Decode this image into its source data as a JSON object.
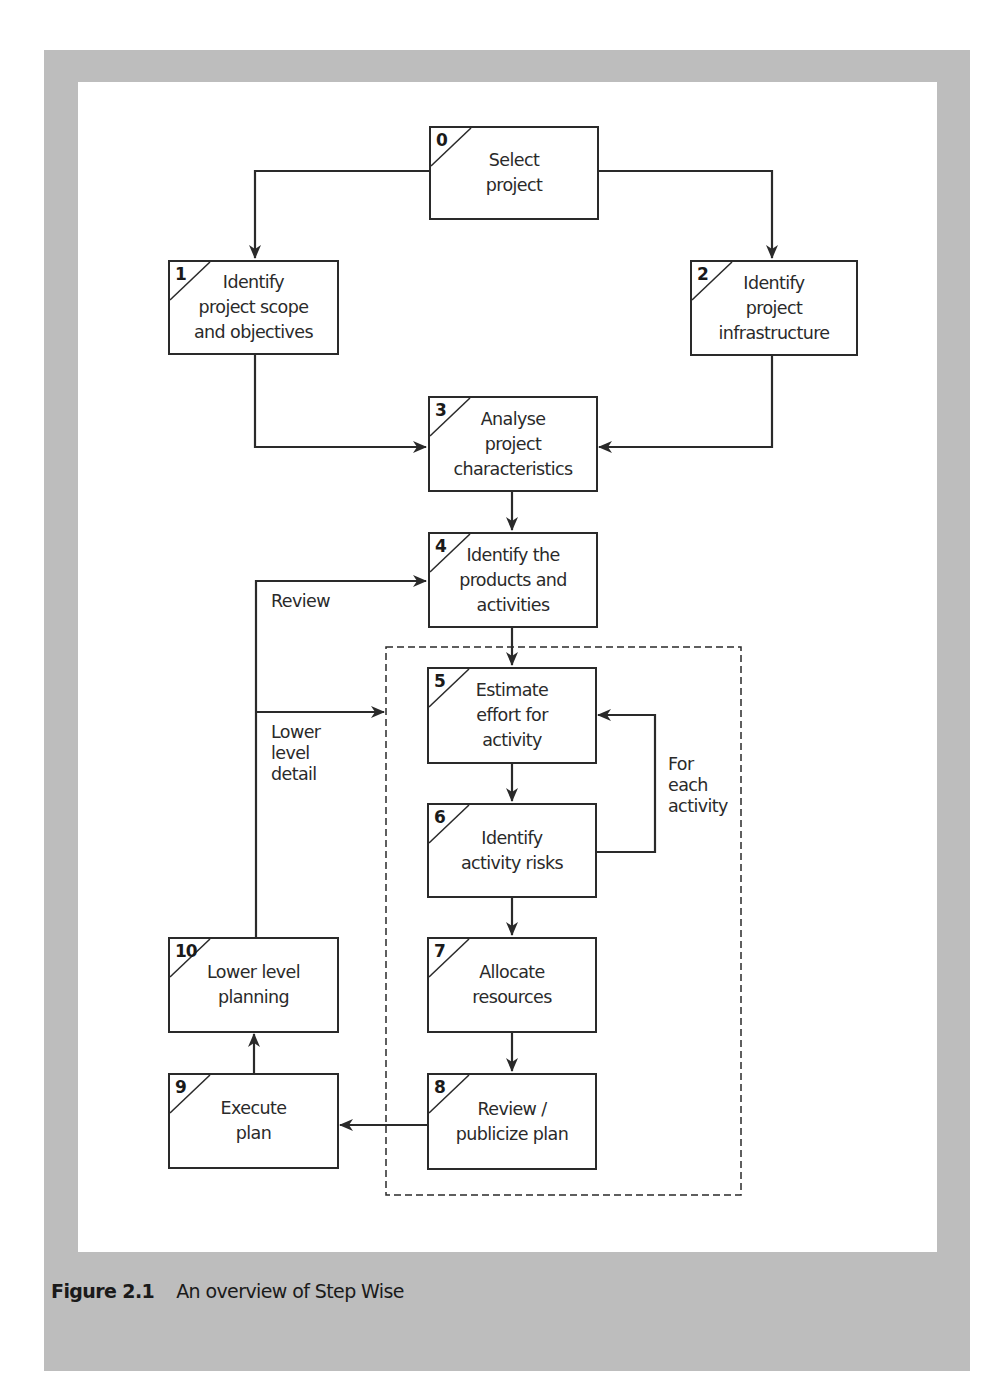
{
  "figure": {
    "number_label": "Figure 2.1",
    "title": "An overview of Step Wise"
  },
  "colors": {
    "frame": "#bdbdbd",
    "line": "#2a2a2a",
    "background": "#ffffff"
  },
  "steps": [
    {
      "id": "0",
      "label": "Select\nproject"
    },
    {
      "id": "1",
      "label": "Identify\nproject scope\nand objectives"
    },
    {
      "id": "2",
      "label": "Identify\nproject\ninfrastructure"
    },
    {
      "id": "3",
      "label": "Analyse\nproject\ncharacteristics"
    },
    {
      "id": "4",
      "label": "Identify the\nproducts and\nactivities"
    },
    {
      "id": "5",
      "label": "Estimate\neffort for\nactivity"
    },
    {
      "id": "6",
      "label": "Identify\nactivity risks"
    },
    {
      "id": "7",
      "label": "Allocate\nresources"
    },
    {
      "id": "8",
      "label": "Review /\npublicize plan"
    },
    {
      "id": "9",
      "label": "Execute\nplan"
    },
    {
      "id": "10",
      "label": "Lower level\nplanning"
    }
  ],
  "annotations": {
    "review": "Review",
    "lower_level_detail": "Lower\nlevel\ndetail",
    "for_each_activity": "For\neach\nactivity"
  },
  "edges": [
    {
      "from": "0",
      "to": "1"
    },
    {
      "from": "0",
      "to": "2"
    },
    {
      "from": "1",
      "to": "3"
    },
    {
      "from": "2",
      "to": "3"
    },
    {
      "from": "3",
      "to": "4"
    },
    {
      "from": "4",
      "to": "5"
    },
    {
      "from": "5",
      "to": "6"
    },
    {
      "from": "6",
      "to": "5",
      "label": "For each activity"
    },
    {
      "from": "6",
      "to": "7"
    },
    {
      "from": "7",
      "to": "8"
    },
    {
      "from": "8",
      "to": "9"
    },
    {
      "from": "9",
      "to": "10"
    },
    {
      "from": "10",
      "to": "4",
      "label": "Review"
    },
    {
      "from": "10",
      "to": "5-8 group",
      "label": "Lower level detail"
    }
  ]
}
